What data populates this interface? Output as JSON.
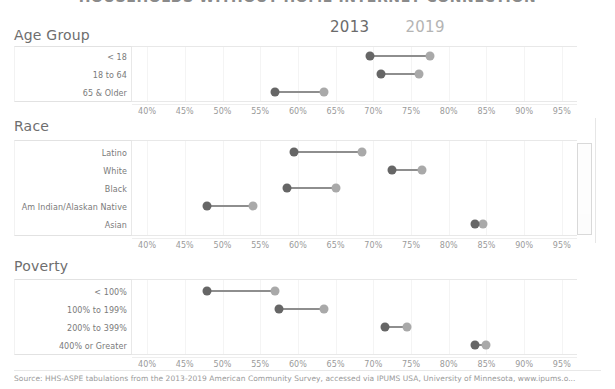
{
  "chart_title": "HOUSEHOLDS WITHOUT HOME INTERNET CONNECTION",
  "legend": {
    "items": [
      {
        "label": "2013",
        "color": "#666666"
      },
      {
        "label": "2019",
        "color": "#a9a9a9"
      }
    ]
  },
  "axis": {
    "ticks": [
      "40%",
      "45%",
      "50%",
      "55%",
      "60%",
      "65%",
      "70%",
      "75%",
      "80%",
      "85%",
      "90%",
      "95%"
    ],
    "min": 38.0,
    "max": 97.0
  },
  "panels": [
    {
      "title": "Age Group",
      "rows": [
        {
          "label": "< 18",
          "v2013": 69.5,
          "v2019": 77.5
        },
        {
          "label": "18 to 64",
          "v2013": 71.0,
          "v2019": 76.0
        },
        {
          "label": "65 & Older",
          "v2013": 57.0,
          "v2019": 63.5
        }
      ]
    },
    {
      "title": "Race",
      "rows": [
        {
          "label": "Latino",
          "v2013": 59.5,
          "v2019": 68.5
        },
        {
          "label": "White",
          "v2013": 72.5,
          "v2019": 76.5
        },
        {
          "label": "Black",
          "v2013": 58.5,
          "v2019": 65.0
        },
        {
          "label": "Am Indian/Alaskan Native",
          "v2013": 48.0,
          "v2019": 54.0
        },
        {
          "label": "Asian",
          "v2013": 83.5,
          "v2019": 84.5
        }
      ]
    },
    {
      "title": "Poverty",
      "rows": [
        {
          "label": "< 100%",
          "v2013": 48.0,
          "v2019": 57.0
        },
        {
          "label": "100% to 199%",
          "v2013": 57.5,
          "v2019": 63.5
        },
        {
          "label": "200% to 399%",
          "v2013": 71.5,
          "v2019": 74.5
        },
        {
          "label": "400% or Greater",
          "v2013": 83.5,
          "v2019": 85.0
        }
      ]
    }
  ],
  "source": "Source: HHS-ASPE tabulations from the 2013-2019 American Community Survey, accessed via IPUMS USA, University of Minnesota, www.ipums.o...",
  "colors": {
    "color_2013": "#666666",
    "color_2019": "#a9a9a9",
    "connector": "#8e8e8e"
  },
  "chart_data": {
    "type": "scatter",
    "title": "HOUSEHOLDS WITHOUT HOME INTERNET CONNECTION",
    "xlabel": "",
    "ylabel": "",
    "xlim": [
      38,
      97
    ],
    "grid": true,
    "legend_position": "top-center",
    "xticks": [
      40,
      45,
      50,
      55,
      60,
      65,
      70,
      75,
      80,
      85,
      90,
      95
    ],
    "xtick_labels": [
      "40%",
      "45%",
      "50%",
      "55%",
      "60%",
      "65%",
      "70%",
      "75%",
      "80%",
      "85%",
      "90%",
      "95%"
    ],
    "series": [
      {
        "name": "2013",
        "color": "#666666",
        "values": [
          69.5,
          71.0,
          57.0,
          59.5,
          72.5,
          58.5,
          48.0,
          83.5,
          48.0,
          57.5,
          71.5,
          83.5
        ]
      },
      {
        "name": "2019",
        "color": "#a9a9a9",
        "values": [
          77.5,
          76.0,
          63.5,
          68.5,
          76.5,
          65.0,
          54.0,
          84.5,
          57.0,
          63.5,
          74.5,
          85.0
        ]
      }
    ],
    "categories": [
      "< 18",
      "18 to 64",
      "65 & Older",
      "Latino",
      "White",
      "Black",
      "Am Indian/Alaskan Native",
      "Asian",
      "< 100%",
      "100% to 199%",
      "200% to 399%",
      "400% or Greater"
    ],
    "groups": [
      {
        "name": "Age Group",
        "categories": [
          "< 18",
          "18 to 64",
          "65 & Older"
        ]
      },
      {
        "name": "Race",
        "categories": [
          "Latino",
          "White",
          "Black",
          "Am Indian/Alaskan Native",
          "Asian"
        ]
      },
      {
        "name": "Poverty",
        "categories": [
          "< 100%",
          "100% to 199%",
          "200% to 399%",
          "400% or Greater"
        ]
      }
    ],
    "annotations": [
      "Source: HHS-ASPE tabulations from the 2013-2019 American Community Survey, accessed via IPUMS USA, University of Minnesota, www.ipums.o..."
    ]
  }
}
